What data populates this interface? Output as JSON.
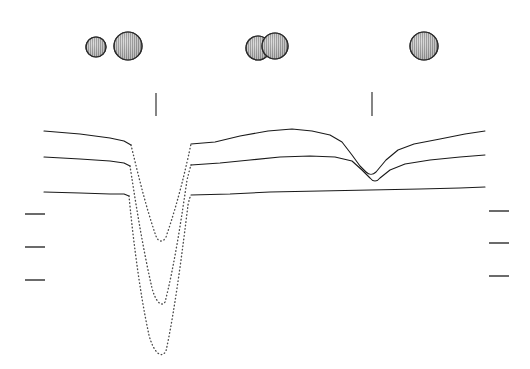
{
  "figure": {
    "title": "",
    "background_color": "#ffffff",
    "width": 530,
    "height": 369,
    "line_color": "#1a1a1a",
    "dotted_color": "#4a4a4a",
    "tick_color": "#3a3a3a",
    "sphere_fill": "#9a9a9a",
    "sphere_outline": "#2a2a2a"
  },
  "chart_data": {
    "type": "line",
    "title": "",
    "xlabel": "",
    "ylabel": "",
    "xlim": [
      0,
      530
    ],
    "ylim": [
      369,
      0
    ],
    "grid": false,
    "legend": "none",
    "axes_visible": false,
    "annotations": [
      {
        "name": "sphere-small-left",
        "shape": "circle",
        "cx": 96,
        "cy": 47,
        "r": 10,
        "fill": "hatched-grey",
        "label": ""
      },
      {
        "name": "sphere-large-left",
        "shape": "circle",
        "cx": 128,
        "cy": 46,
        "r": 14,
        "fill": "hatched-grey",
        "label": ""
      },
      {
        "name": "sphere-left-of-pair-middle",
        "shape": "circle",
        "cx": 258,
        "cy": 48,
        "r": 12,
        "fill": "hatched-grey",
        "label": ""
      },
      {
        "name": "sphere-right-of-pair-middle",
        "shape": "circle",
        "cx": 275,
        "cy": 46,
        "r": 13,
        "fill": "hatched-grey",
        "label": ""
      },
      {
        "name": "sphere-right",
        "shape": "circle",
        "cx": 424,
        "cy": 46,
        "r": 14,
        "fill": "hatched-grey",
        "label": ""
      }
    ],
    "marker_ticks_vertical": [
      {
        "name": "tick-marker-left",
        "x": 156,
        "y1": 93,
        "y2": 116
      },
      {
        "name": "tick-marker-right",
        "x": 372,
        "y1": 92,
        "y2": 116
      }
    ],
    "scale_ticks_left": [
      {
        "name": "scale-tick-left-1",
        "x1": 25,
        "x2": 45,
        "y": 214
      },
      {
        "name": "scale-tick-left-2",
        "x1": 25,
        "x2": 45,
        "y": 247
      },
      {
        "name": "scale-tick-left-3",
        "x1": 25,
        "x2": 45,
        "y": 280
      }
    ],
    "scale_ticks_right": [
      {
        "name": "scale-tick-right-1",
        "x1": 489,
        "x2": 509,
        "y": 211
      },
      {
        "name": "scale-tick-right-2",
        "x1": 489,
        "x2": 509,
        "y": 243
      },
      {
        "name": "scale-tick-right-3",
        "x1": 489,
        "x2": 509,
        "y": 276
      }
    ],
    "series": [
      {
        "name": "curve-upper",
        "style": "solid-with-dotted-dip",
        "dip_depth_px": 242,
        "dip_center_x": 161,
        "solid_left": "M 44,131 L 80,134 L 110,138 L 124,141 L 131,145",
        "dotted_dip": "M 131,145 C 136,165 145,205 156,236 C 158,242 163,243 166,237 C 176,208 183,180 187,162 C 189,154 190,148 191,144",
        "solid_right": "M 191,144 L 215,142 L 240,136 L 268,131 L 292,129 L 312,131 L 330,135 L 342,142 L 352,155 L 360,166 L 366,172 C 369,175 373,175 376,172 L 386,160 L 398,150 L 414,144 L 440,139 L 465,134 L 485,131"
      },
      {
        "name": "curve-middle",
        "style": "solid-with-dotted-dip",
        "dip_depth_px": 307,
        "dip_center_x": 160,
        "solid_left": "M 44,157 L 80,159 L 110,161 L 124,163 L 130,166",
        "dotted_dip": "M 130,166 C 134,192 142,245 152,288 C 155,300 161,308 165,302 C 174,268 182,215 187,180 C 189,172 190,168 191,165",
        "solid_right": "M 191,165 L 220,163 L 250,160 L 280,157 L 310,156 L 335,157 L 352,161 L 362,170 L 370,178 C 373,182 377,182 380,178 L 390,170 L 405,164 L 430,160 L 460,157 L 485,155"
      },
      {
        "name": "curve-lower",
        "style": "solid-with-dotted-dip",
        "dip_depth_px": 357,
        "dip_center_x": 160,
        "solid_left": "M 44,192 L 80,193 L 110,194 L 124,194 L 129,196",
        "dotted_dip": "M 129,196 C 132,228 139,290 149,335 C 153,351 161,360 166,351 C 175,310 183,246 188,205 C 189,200 190,197 191,195",
        "solid_right": "M 191,195 L 230,194 L 270,192 L 320,191 L 370,190 L 420,189 L 460,188 L 485,187"
      }
    ]
  }
}
